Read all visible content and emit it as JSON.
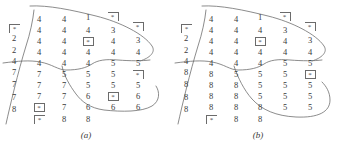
{
  "figure": {
    "type": "scanned-figure",
    "ink_color": "#3a3a3a",
    "curve_color": "#6f6f6f",
    "background": "#ffffff"
  },
  "panels": [
    {
      "id": "a",
      "caption": "(a)",
      "columns": [
        {
          "x": 14,
          "cells": [
            {
              "y": 24,
              "text": "*",
              "marker": "bracket"
            },
            {
              "y": 34,
              "text": "2",
              "marker": "none"
            },
            {
              "y": 46,
              "text": "2",
              "marker": "none"
            },
            {
              "y": 57,
              "text": "4",
              "marker": "none"
            },
            {
              "y": 68,
              "text": "7",
              "marker": "none"
            },
            {
              "y": 80,
              "text": "7",
              "marker": "none"
            },
            {
              "y": 93,
              "text": "7",
              "marker": "none"
            },
            {
              "y": 105,
              "text": "8",
              "marker": "none"
            }
          ]
        },
        {
          "x": 39,
          "cells": [
            {
              "y": 15,
              "text": "4",
              "marker": "none"
            },
            {
              "y": 26,
              "text": "4",
              "marker": "none"
            },
            {
              "y": 37,
              "text": "4",
              "marker": "none"
            },
            {
              "y": 48,
              "text": "4",
              "marker": "none"
            },
            {
              "y": 59,
              "text": "4",
              "marker": "none"
            },
            {
              "y": 70,
              "text": "7",
              "marker": "none"
            },
            {
              "y": 81,
              "text": "7",
              "marker": "none"
            },
            {
              "y": 92,
              "text": "7",
              "marker": "none"
            },
            {
              "y": 103,
              "text": "*",
              "marker": "box"
            },
            {
              "y": 115,
              "text": "*",
              "marker": "bracket"
            }
          ]
        },
        {
          "x": 64,
          "cells": [
            {
              "y": 15,
              "text": "4",
              "marker": "none"
            },
            {
              "y": 26,
              "text": "4",
              "marker": "none"
            },
            {
              "y": 37,
              "text": "4",
              "marker": "none"
            },
            {
              "y": 48,
              "text": "4",
              "marker": "none"
            },
            {
              "y": 59,
              "text": "4",
              "marker": "none"
            },
            {
              "y": 70,
              "text": "5",
              "marker": "none"
            },
            {
              "y": 81,
              "text": "7",
              "marker": "none"
            },
            {
              "y": 92,
              "text": "7",
              "marker": "none"
            },
            {
              "y": 103,
              "text": "7",
              "marker": "none"
            },
            {
              "y": 115,
              "text": "8",
              "marker": "none"
            }
          ]
        },
        {
          "x": 88,
          "cells": [
            {
              "y": 13,
              "text": "1",
              "marker": "none"
            },
            {
              "y": 26,
              "text": "4",
              "marker": "none"
            },
            {
              "y": 37,
              "text": "*",
              "marker": "box"
            },
            {
              "y": 48,
              "text": "4",
              "marker": "none"
            },
            {
              "y": 59,
              "text": "4",
              "marker": "none"
            },
            {
              "y": 70,
              "text": "5",
              "marker": "none"
            },
            {
              "y": 81,
              "text": "5",
              "marker": "none"
            },
            {
              "y": 92,
              "text": "6",
              "marker": "none"
            },
            {
              "y": 103,
              "text": "6",
              "marker": "none"
            },
            {
              "y": 115,
              "text": "8",
              "marker": "none"
            }
          ]
        },
        {
          "x": 113,
          "cells": [
            {
              "y": 12,
              "text": "*",
              "marker": "bracket"
            },
            {
              "y": 26,
              "text": "3",
              "marker": "none"
            },
            {
              "y": 37,
              "text": "4",
              "marker": "none"
            },
            {
              "y": 48,
              "text": "4",
              "marker": "none"
            },
            {
              "y": 59,
              "text": "5",
              "marker": "none"
            },
            {
              "y": 70,
              "text": "5",
              "marker": "none"
            },
            {
              "y": 81,
              "text": "5",
              "marker": "none"
            },
            {
              "y": 92,
              "text": "*",
              "marker": "box"
            },
            {
              "y": 103,
              "text": "6",
              "marker": "none"
            }
          ]
        },
        {
          "x": 138,
          "cells": [
            {
              "y": 22,
              "text": "*",
              "marker": "bracket"
            },
            {
              "y": 36,
              "text": "3",
              "marker": "none"
            },
            {
              "y": 48,
              "text": "4",
              "marker": "none"
            },
            {
              "y": 59,
              "text": "5",
              "marker": "none"
            },
            {
              "y": 70,
              "text": "*",
              "marker": "bracket"
            },
            {
              "y": 81,
              "text": "5",
              "marker": "none"
            },
            {
              "y": 92,
              "text": "6",
              "marker": "none"
            },
            {
              "y": 103,
              "text": "6",
              "marker": "none"
            }
          ]
        }
      ],
      "curves": [
        "M 30 6 C 48 5, 72 10, 96 16 C 120 22, 144 34, 152 46 C 156 52, 150 58, 140 61",
        "M 6 124 C 10 106, 18 72, 26 46 C 30 34, 33 20, 34 10",
        "M 3 63 C 18 61, 30 60, 40 62 C 52 64, 58 70, 66 70 C 78 70, 86 68, 92 64 C 98 60, 106 59, 118 60 C 130 61, 142 61, 150 60",
        "M 62 66 C 64 76, 70 86, 76 94 C 82 102, 90 108, 104 110 C 122 112, 142 112, 152 106 C 160 101, 160 92, 156 86"
      ]
    },
    {
      "id": "b",
      "caption": "(b)",
      "columns": [
        {
          "x": 14,
          "cells": [
            {
              "y": 24,
              "text": "*",
              "marker": "bracket"
            },
            {
              "y": 34,
              "text": "2",
              "marker": "none"
            },
            {
              "y": 46,
              "text": "2",
              "marker": "none"
            },
            {
              "y": 57,
              "text": "4",
              "marker": "none"
            },
            {
              "y": 68,
              "text": "8",
              "marker": "none"
            },
            {
              "y": 80,
              "text": "8",
              "marker": "none"
            },
            {
              "y": 93,
              "text": "8",
              "marker": "none"
            },
            {
              "y": 105,
              "text": "8",
              "marker": "none"
            }
          ]
        },
        {
          "x": 39,
          "cells": [
            {
              "y": 15,
              "text": "4",
              "marker": "none"
            },
            {
              "y": 26,
              "text": "4",
              "marker": "none"
            },
            {
              "y": 37,
              "text": "4",
              "marker": "none"
            },
            {
              "y": 48,
              "text": "4",
              "marker": "none"
            },
            {
              "y": 59,
              "text": "4",
              "marker": "none"
            },
            {
              "y": 70,
              "text": "8",
              "marker": "none"
            },
            {
              "y": 81,
              "text": "8",
              "marker": "none"
            },
            {
              "y": 92,
              "text": "8",
              "marker": "none"
            },
            {
              "y": 103,
              "text": "8",
              "marker": "none"
            },
            {
              "y": 115,
              "text": "*",
              "marker": "bracket"
            }
          ]
        },
        {
          "x": 64,
          "cells": [
            {
              "y": 15,
              "text": "4",
              "marker": "none"
            },
            {
              "y": 26,
              "text": "4",
              "marker": "none"
            },
            {
              "y": 37,
              "text": "4",
              "marker": "none"
            },
            {
              "y": 48,
              "text": "4",
              "marker": "none"
            },
            {
              "y": 59,
              "text": "4",
              "marker": "none"
            },
            {
              "y": 70,
              "text": "5",
              "marker": "none"
            },
            {
              "y": 81,
              "text": "8",
              "marker": "none"
            },
            {
              "y": 92,
              "text": "8",
              "marker": "none"
            },
            {
              "y": 103,
              "text": "8",
              "marker": "none"
            },
            {
              "y": 115,
              "text": "8",
              "marker": "none"
            }
          ]
        },
        {
          "x": 88,
          "cells": [
            {
              "y": 13,
              "text": "1",
              "marker": "none"
            },
            {
              "y": 26,
              "text": "4",
              "marker": "none"
            },
            {
              "y": 37,
              "text": "*",
              "marker": "box"
            },
            {
              "y": 48,
              "text": "4",
              "marker": "none"
            },
            {
              "y": 59,
              "text": "4",
              "marker": "none"
            },
            {
              "y": 70,
              "text": "5",
              "marker": "none"
            },
            {
              "y": 81,
              "text": "5",
              "marker": "none"
            },
            {
              "y": 92,
              "text": "5",
              "marker": "none"
            },
            {
              "y": 103,
              "text": "8",
              "marker": "none"
            },
            {
              "y": 115,
              "text": "8",
              "marker": "none"
            }
          ]
        },
        {
          "x": 113,
          "cells": [
            {
              "y": 12,
              "text": "*",
              "marker": "bracket"
            },
            {
              "y": 26,
              "text": "3",
              "marker": "none"
            },
            {
              "y": 37,
              "text": "4",
              "marker": "none"
            },
            {
              "y": 48,
              "text": "4",
              "marker": "none"
            },
            {
              "y": 59,
              "text": "5",
              "marker": "none"
            },
            {
              "y": 70,
              "text": "5",
              "marker": "none"
            },
            {
              "y": 81,
              "text": "5",
              "marker": "none"
            },
            {
              "y": 92,
              "text": "5",
              "marker": "none"
            },
            {
              "y": 103,
              "text": "5",
              "marker": "none"
            }
          ]
        },
        {
          "x": 138,
          "cells": [
            {
              "y": 22,
              "text": "*",
              "marker": "bracket"
            },
            {
              "y": 36,
              "text": "3",
              "marker": "none"
            },
            {
              "y": 48,
              "text": "4",
              "marker": "none"
            },
            {
              "y": 59,
              "text": "5",
              "marker": "none"
            },
            {
              "y": 70,
              "text": "*",
              "marker": "box"
            },
            {
              "y": 81,
              "text": "5",
              "marker": "none"
            },
            {
              "y": 92,
              "text": "5",
              "marker": "none"
            },
            {
              "y": 103,
              "text": "5",
              "marker": "none"
            }
          ]
        }
      ],
      "curves": [
        "M 30 6 C 48 5, 72 10, 96 16 C 120 22, 144 34, 152 46 C 156 52, 150 58, 140 61",
        "M 6 124 C 10 106, 18 72, 26 46 C 30 34, 33 20, 34 10",
        "M 3 63 C 18 61, 30 60, 40 62 C 52 64, 58 70, 66 70 C 78 70, 86 68, 92 64 C 98 60, 106 59, 118 60 C 130 61, 142 61, 150 60",
        "M 62 66 C 66 78, 72 90, 80 99 C 90 110, 104 116, 124 117 C 146 118, 158 112, 158 100 C 158 92, 154 86, 150 82"
      ]
    }
  ]
}
